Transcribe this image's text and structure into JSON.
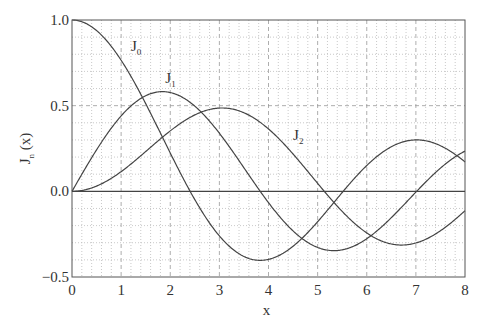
{
  "chart_data": {
    "type": "line",
    "title": "",
    "xlabel": "x",
    "ylabel": "J_n (x)",
    "xlim": [
      0,
      8
    ],
    "ylim": [
      -0.5,
      1.0
    ],
    "xticks": [
      "0",
      "1",
      "2",
      "3",
      "4",
      "5",
      "6",
      "7",
      "8"
    ],
    "yticks": [
      "-0.5",
      "0.0",
      "0.5",
      "1.0"
    ],
    "grid": true,
    "legend": "inline labels",
    "x": [
      0,
      0.5,
      1,
      1.5,
      2,
      2.5,
      3,
      3.5,
      4,
      4.5,
      5,
      5.5,
      6,
      6.5,
      7,
      7.5,
      8
    ],
    "series": [
      {
        "name": "J0",
        "values": [
          1.0,
          0.938,
          0.765,
          0.512,
          0.224,
          -0.048,
          -0.26,
          -0.38,
          -0.397,
          -0.321,
          -0.178,
          -0.007,
          0.151,
          0.26,
          0.3,
          0.266,
          0.172
        ]
      },
      {
        "name": "J1",
        "values": [
          0.0,
          0.242,
          0.44,
          0.558,
          0.577,
          0.497,
          0.339,
          0.137,
          -0.066,
          -0.231,
          -0.328,
          -0.341,
          -0.277,
          -0.154,
          -0.005,
          0.135,
          0.235
        ]
      },
      {
        "name": "J2",
        "values": [
          0.0,
          0.031,
          0.115,
          0.232,
          0.353,
          0.446,
          0.486,
          0.459,
          0.364,
          0.218,
          0.047,
          -0.117,
          -0.243,
          -0.307,
          -0.301,
          -0.23,
          -0.113
        ]
      }
    ],
    "annotations": [
      {
        "text": "J",
        "sub": "0",
        "x": 1.2,
        "y": 0.82
      },
      {
        "text": "J",
        "sub": "1",
        "x": 1.9,
        "y": 0.63
      },
      {
        "text": "J",
        "sub": "2",
        "x": 4.5,
        "y": 0.3
      }
    ]
  }
}
